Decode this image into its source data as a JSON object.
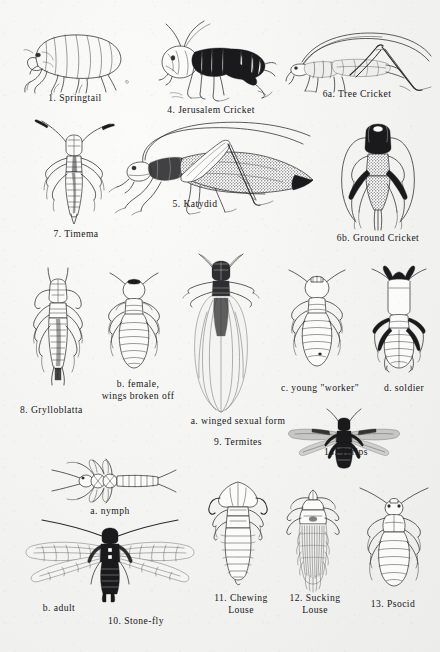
{
  "plate": {
    "kind": "insect-identification-plate",
    "background_color": "#f2f2f0",
    "ink_color": "#1b1b1b",
    "figure_count": 14
  },
  "figures": [
    {
      "id": "1",
      "caption": "1. Springtail",
      "name": "springtail",
      "row": 1,
      "col": 1
    },
    {
      "id": "4",
      "caption": "4. Jerusalem Cricket",
      "name": "jerusalem-cricket",
      "row": 1,
      "col": 2
    },
    {
      "id": "6a",
      "caption": "6a. Tree Cricket",
      "name": "tree-cricket",
      "row": 1,
      "col": 3
    },
    {
      "id": "7",
      "caption": "7. Timema",
      "name": "timema",
      "row": 2,
      "col": 1
    },
    {
      "id": "5",
      "caption": "5. Katydid",
      "name": "katydid",
      "row": 2,
      "col": 2
    },
    {
      "id": "6b",
      "caption": "6b. Ground Cricket",
      "name": "ground-cricket",
      "row": 2,
      "col": 3
    },
    {
      "id": "8",
      "caption": "8. Grylloblatta",
      "name": "grylloblatta",
      "row": 3,
      "col": 1
    },
    {
      "id": "9",
      "caption": "9. Termites",
      "name": "termites-group",
      "row": 3,
      "col": 2
    },
    {
      "id": "14",
      "caption": "14. Thrips",
      "name": "thrips",
      "row": 3,
      "col": 3
    },
    {
      "id": "10",
      "caption": "10. Stone-fly",
      "name": "stone-fly",
      "row": 4,
      "col": 1
    },
    {
      "id": "11",
      "caption": "11. Chewing Louse",
      "name": "chewing-louse",
      "row": 4,
      "col": 2
    },
    {
      "id": "12",
      "caption": "12. Sucking Louse",
      "name": "sucking-louse",
      "row": 4,
      "col": 3
    },
    {
      "id": "13",
      "caption": "13. Psocid",
      "name": "psocid",
      "row": 4,
      "col": 4
    }
  ],
  "captions": {
    "springtail": "1. Springtail",
    "jerusalem_cricket": "4. Jerusalem Cricket",
    "tree_cricket": "6a. Tree Cricket",
    "timema": "7. Timema",
    "katydid": "5. Katydid",
    "ground_cricket": "6b. Ground Cricket",
    "grylloblatta": "8. Grylloblatta",
    "termite_female_line1": "b. female,",
    "termite_female_line2": "wings broken off",
    "termite_winged": "a. winged sexual form",
    "termite_worker": "c. young \"worker\"",
    "termite_soldier": "d. soldier",
    "termites": "9. Termites",
    "thrips": "14. Thrips",
    "stonefly_nymph": "a. nymph",
    "stonefly_adult": "b. adult",
    "stonefly": "10. Stone-fly",
    "chewing_louse_line1": "11. Chewing",
    "chewing_louse_line2": "Louse",
    "sucking_louse_line1": "12. Sucking",
    "sucking_louse_line2": "Louse",
    "psocid": "13. Psocid"
  }
}
